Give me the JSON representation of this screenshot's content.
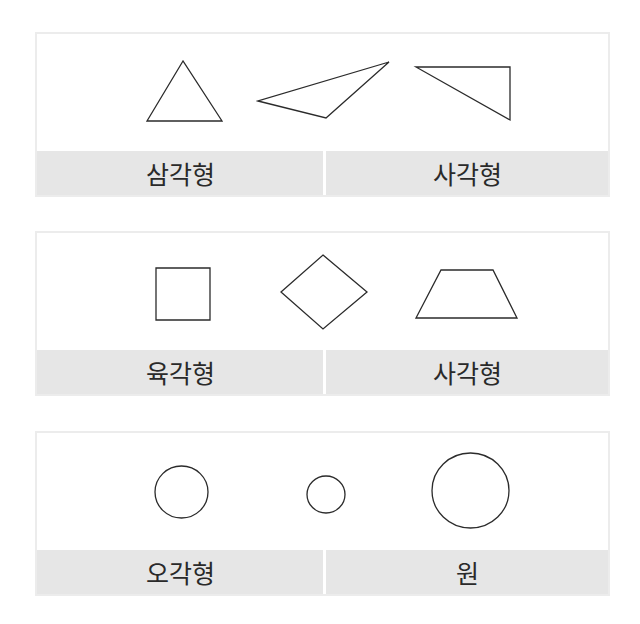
{
  "panels": [
    {
      "shapes": [
        {
          "type": "polygon",
          "name": "equilateral-triangle",
          "points": "181,27 145,87 220,87"
        },
        {
          "type": "polygon",
          "name": "obtuse-triangle",
          "points": "256,67 324,84 387,28"
        },
        {
          "type": "polygon",
          "name": "right-triangle",
          "points": "414,33 508,33 508,86"
        }
      ],
      "labels": {
        "left": "삼각형",
        "right": "사각형"
      }
    },
    {
      "shapes": [
        {
          "type": "polygon",
          "name": "square",
          "points": "154,35 208,35 208,87 154,87"
        },
        {
          "type": "polygon",
          "name": "diamond",
          "points": "321,22 365,59 321,96 279,59"
        },
        {
          "type": "polygon",
          "name": "trapezoid",
          "points": "439,37 491,37 515,85 414,85"
        }
      ],
      "labels": {
        "left": "육각형",
        "right": "사각형"
      }
    },
    {
      "shapes": [
        {
          "type": "ellipse",
          "name": "circle-medium",
          "cx": 179.5,
          "cy": 59,
          "rx": 26.5,
          "ry": 26
        },
        {
          "type": "ellipse",
          "name": "circle-small",
          "cx": 324,
          "cy": 61.5,
          "rx": 19,
          "ry": 18.5
        },
        {
          "type": "ellipse",
          "name": "circle-large",
          "cx": 468.5,
          "cy": 57.5,
          "rx": 38.5,
          "ry": 37.5
        }
      ],
      "labels": {
        "left": "오각형",
        "right": "원"
      }
    }
  ],
  "colors": {
    "band": "#e6e6e6",
    "border": "#ececec",
    "stroke": "#2b2b2b",
    "text": "#2a2a2a"
  }
}
